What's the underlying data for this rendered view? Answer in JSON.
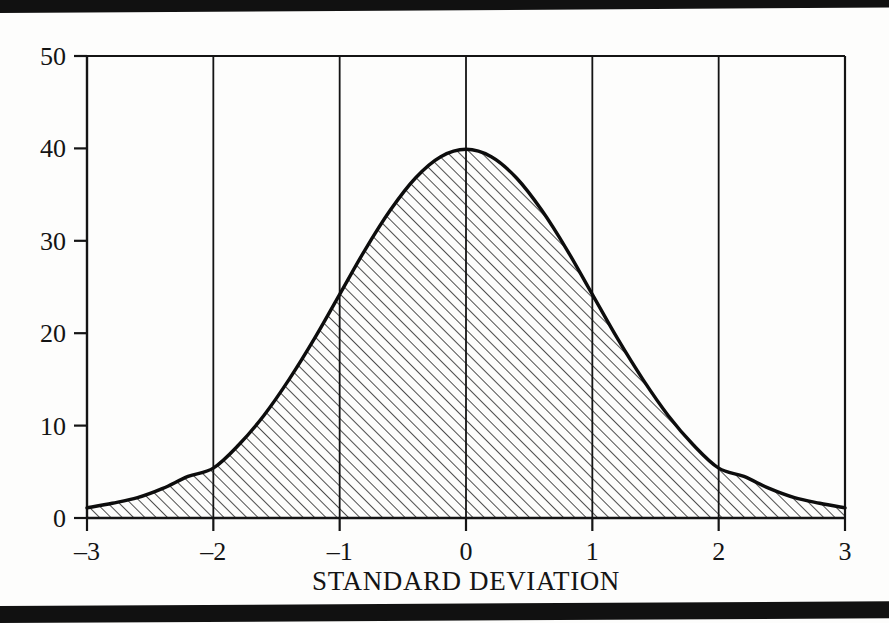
{
  "figure": {
    "name": "normal-distribution-bell-curve",
    "background_color": "#fdfdfc",
    "ink_color": "#111111",
    "scan_bar_color": "#111111"
  },
  "chart_data": {
    "type": "area",
    "title": "",
    "subtitle": "",
    "xlabel": "STANDARD DEVIATION",
    "ylabel": "",
    "xlim": [
      -3,
      3
    ],
    "ylim": [
      0,
      50
    ],
    "grid": "vertical-only",
    "legend": "none",
    "fill_style": "diagonal-hatch",
    "curve_name": "standard normal probability density (×100)",
    "x_tick_labels": [
      "–3",
      "–2",
      "–1",
      "0",
      "1",
      "2",
      "3"
    ],
    "x_tick_values": [
      -3,
      -2,
      -1,
      0,
      1,
      2,
      3
    ],
    "y_tick_labels": [
      "0",
      "10",
      "20",
      "30",
      "40",
      "50"
    ],
    "y_tick_values": [
      0,
      10,
      20,
      30,
      40,
      50
    ],
    "x": [
      -3.0,
      -2.8,
      -2.6,
      -2.4,
      -2.2,
      -2.0,
      -1.8,
      -1.6,
      -1.4,
      -1.2,
      -1.0,
      -0.8,
      -0.6,
      -0.4,
      -0.2,
      0.0,
      0.2,
      0.4,
      0.6,
      0.8,
      1.0,
      1.2,
      1.4,
      1.6,
      1.8,
      2.0,
      2.2,
      2.4,
      2.6,
      2.8,
      3.0
    ],
    "values": [
      1.1,
      1.6,
      2.2,
      3.2,
      4.5,
      5.4,
      7.9,
      11.1,
      15.0,
      19.4,
      24.2,
      29.0,
      33.3,
      36.8,
      39.1,
      39.9,
      39.1,
      36.8,
      33.3,
      29.0,
      24.2,
      19.4,
      15.0,
      11.1,
      7.9,
      5.4,
      4.5,
      3.2,
      2.2,
      1.6,
      1.1
    ],
    "peak": {
      "x": 0,
      "y": 39.9
    },
    "annotations": []
  },
  "axes": {
    "x_axis_label": "STANDARD DEVIATION",
    "y_axis_label": ""
  }
}
